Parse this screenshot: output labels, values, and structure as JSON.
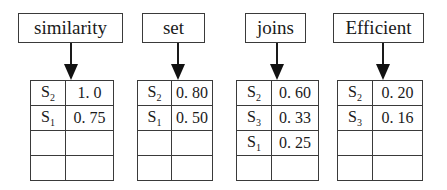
{
  "terms": [
    {
      "label": "similarity",
      "postings": [
        {
          "doc": "S",
          "sub": "2",
          "score": "1. 0"
        },
        {
          "doc": "S",
          "sub": "1",
          "score": "0. 75"
        },
        {
          "doc": "",
          "sub": "",
          "score": ""
        },
        {
          "doc": "",
          "sub": "",
          "score": ""
        }
      ]
    },
    {
      "label": "set",
      "postings": [
        {
          "doc": "S",
          "sub": "2",
          "score": "0. 80"
        },
        {
          "doc": "S",
          "sub": "1",
          "score": "0. 50"
        },
        {
          "doc": "",
          "sub": "",
          "score": ""
        },
        {
          "doc": "",
          "sub": "",
          "score": ""
        }
      ]
    },
    {
      "label": "joins",
      "postings": [
        {
          "doc": "S",
          "sub": "2",
          "score": "0. 60"
        },
        {
          "doc": "S",
          "sub": "3",
          "score": "0. 33"
        },
        {
          "doc": "S",
          "sub": "1",
          "score": "0. 25"
        },
        {
          "doc": "",
          "sub": "",
          "score": ""
        }
      ]
    },
    {
      "label": "Efficient",
      "postings": [
        {
          "doc": "S",
          "sub": "2",
          "score": "0. 20"
        },
        {
          "doc": "S",
          "sub": "3",
          "score": "0. 16"
        },
        {
          "doc": "",
          "sub": "",
          "score": ""
        },
        {
          "doc": "",
          "sub": "",
          "score": ""
        }
      ]
    }
  ]
}
